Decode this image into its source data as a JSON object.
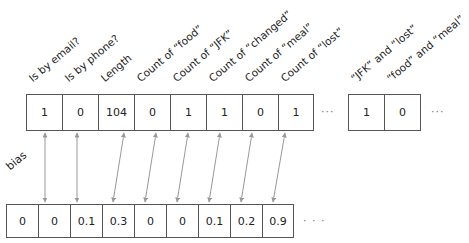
{
  "features": {
    "labels": [
      "Is by email?",
      "Is by phone?",
      "Length",
      "Count of “food”",
      "Count of “JFK”",
      "Count of “changed”",
      "Count of “meal”",
      "Count of “lost”"
    ],
    "values": [
      "1",
      "0",
      "104",
      "0",
      "1",
      "1",
      "0",
      "1"
    ],
    "ellipsis": "···"
  },
  "pair_features": {
    "labels": [
      "“JFK” and “lost”",
      "“food” and “meal”"
    ],
    "values": [
      "1",
      "0"
    ],
    "ellipsis": "···"
  },
  "weights": {
    "bias_label": "bias",
    "values": [
      "0",
      "0",
      "0.1",
      "0.3",
      "0",
      "0",
      "0.1",
      "0.2",
      "0.9"
    ],
    "ellipsis": "·  ·  ·"
  },
  "colors": {
    "arrow": "#999999",
    "border": "#555555"
  }
}
